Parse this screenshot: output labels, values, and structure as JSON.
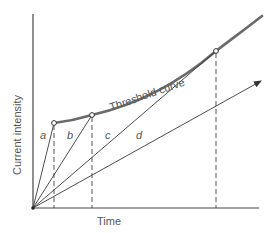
{
  "diagram": {
    "xlabel": "Time",
    "ylabel": "Current intensity",
    "curve_label": "Threshold curve",
    "line_labels": [
      "a",
      "b",
      "c",
      "d"
    ],
    "colors": {
      "axes": "#444444",
      "curve": "#6b6b6b",
      "lines": "#3a3a3a",
      "text": "#555555"
    }
  }
}
